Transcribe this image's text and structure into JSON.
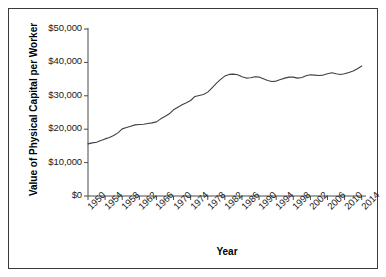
{
  "chart_data": {
    "type": "line",
    "title": "",
    "xlabel": "Year",
    "ylabel": "Value of Physical Capital per Worker",
    "xlim": [
      1950,
      2015
    ],
    "ylim": [
      0,
      50000
    ],
    "grid": false,
    "legend": "none",
    "ytick_labels": [
      "$50,000",
      "$40,000",
      "$30,000",
      "$20,000",
      "$10,000",
      "$0"
    ],
    "ytick_values": [
      50000,
      40000,
      30000,
      20000,
      10000,
      0
    ],
    "xtick_labels": [
      "1950",
      "1954",
      "1958",
      "1962",
      "1966",
      "1970",
      "1974",
      "1978",
      "1982",
      "1986",
      "1990",
      "1994",
      "1998",
      "2002",
      "2006",
      "2010",
      "2014"
    ],
    "xtick_values": [
      1950,
      1954,
      1958,
      1962,
      1966,
      1970,
      1974,
      1978,
      1982,
      1986,
      1990,
      1994,
      1998,
      2002,
      2006,
      2010,
      2014
    ],
    "line_color": "#404040",
    "series": [
      {
        "name": "Value of Physical Capital per Worker",
        "x": [
          1950,
          1951,
          1952,
          1953,
          1954,
          1955,
          1956,
          1957,
          1958,
          1959,
          1960,
          1961,
          1962,
          1963,
          1964,
          1965,
          1966,
          1967,
          1968,
          1969,
          1970,
          1971,
          1972,
          1973,
          1974,
          1975,
          1976,
          1977,
          1978,
          1979,
          1980,
          1981,
          1982,
          1983,
          1984,
          1985,
          1986,
          1987,
          1988,
          1989,
          1990,
          1991,
          1992,
          1993,
          1994,
          1995,
          1996,
          1997,
          1998,
          1999,
          2000,
          2001,
          2002,
          2003,
          2004,
          2005,
          2006,
          2007,
          2008,
          2009,
          2010,
          2011,
          2012,
          2013,
          2014
        ],
        "values": [
          15600,
          15900,
          16100,
          16600,
          17100,
          17500,
          18100,
          18900,
          20100,
          20500,
          20900,
          21300,
          21400,
          21500,
          21700,
          21900,
          22200,
          23100,
          23800,
          24600,
          25800,
          26600,
          27300,
          27900,
          28600,
          29800,
          30100,
          30400,
          31100,
          32400,
          33700,
          34900,
          35900,
          36400,
          36500,
          36300,
          35700,
          35300,
          35400,
          35700,
          35600,
          35100,
          34600,
          34300,
          34400,
          34900,
          35300,
          35600,
          35600,
          35300,
          35500,
          36000,
          36300,
          36200,
          36100,
          36200,
          36600,
          36900,
          36600,
          36400,
          36600,
          37000,
          37400,
          38100,
          38900
        ]
      }
    ]
  }
}
